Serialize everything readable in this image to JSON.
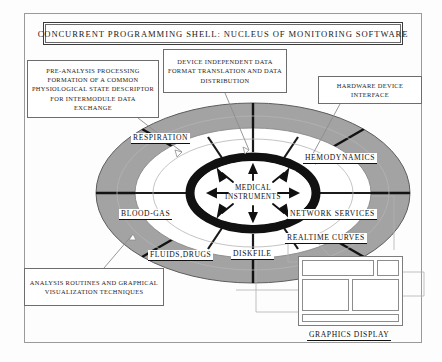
{
  "title": {
    "text": "CONCURRENT PROGRAMMING SHELL: NUCLEUS OF MONITORING SOFTWARE"
  },
  "center": {
    "line1": "MEDICAL",
    "line2": "INSTRUMENTS"
  },
  "callouts": [
    {
      "id": "pre-analysis",
      "text": "PRE-ANALYSIS PROCESSING FORMATION OF A COMMON PHYSIOLOGICAL STATE DESCRIPTOR FOR INTERMODULE DATA EXCHANGE"
    },
    {
      "id": "device-independent",
      "text": "DEVICE INDEPENDENT DATA FORMAT TRANSLATION AND DATA DISTRIBUTION"
    },
    {
      "id": "hardware-device",
      "text": "HARDWARE DEVICE INTERFACE"
    },
    {
      "id": "analysis-routines",
      "text": "ANALYSIS ROUTINES AND GRAPHICAL VISUALIZATION TECHNIQUES"
    }
  ],
  "sectors": [
    {
      "id": "respiration",
      "label": "RESPIRATION"
    },
    {
      "id": "hemodynamics",
      "label": "HEMODYNAMICS"
    },
    {
      "id": "blood-gas",
      "label": "BLOOD-GAS"
    },
    {
      "id": "network-services",
      "label": "NETWORK SERVICES"
    },
    {
      "id": "fluids-drugs",
      "label": "FLUIDS,DRUGS"
    },
    {
      "id": "diskfile",
      "label": "DISKFILE"
    },
    {
      "id": "realtime-curves",
      "label": "REALTIME CURVES"
    }
  ],
  "graphics_display": {
    "label": "GRAPHICS DISPLAY"
  },
  "colors": {
    "ring_outer_fill": "#9e9e9e",
    "ring_inner_black": "#111111",
    "frame_border": "#9a9a9a",
    "text": "#1a1a1a",
    "paper": "#fdfdfd"
  }
}
